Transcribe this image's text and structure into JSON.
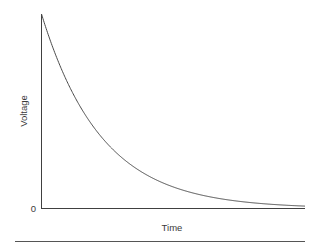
{
  "figure": {
    "background_color": "#ffffff",
    "axis_color": "#404040",
    "curve_color": "#4a4a4a",
    "text_color": "#3a3a3a",
    "rule_color": "#555555"
  },
  "chart_data": {
    "type": "line",
    "title": "",
    "subtitle": "",
    "xlabel": "Time",
    "ylabel": "Voltage",
    "x_tick_labels": [],
    "y_tick_labels": [
      "0"
    ],
    "grid": false,
    "legend": null,
    "annotations": [],
    "xlim": [
      0,
      4.4
    ],
    "ylim": [
      0,
      1.0
    ],
    "series": [
      {
        "name": "Capacitor discharge voltage",
        "description": "exponential decay V = V0 * exp(-t/tau), tau = 1",
        "x": [
          0.0,
          0.1,
          0.2,
          0.3,
          0.4,
          0.5,
          0.6,
          0.7,
          0.8,
          0.9,
          1.0,
          1.2,
          1.4,
          1.6,
          1.8,
          2.0,
          2.2,
          2.4,
          2.6,
          2.8,
          3.0,
          3.2,
          3.4,
          3.6,
          3.8,
          4.0,
          4.2,
          4.4
        ],
        "y": [
          1.0,
          0.905,
          0.819,
          0.741,
          0.67,
          0.607,
          0.549,
          0.497,
          0.449,
          0.407,
          0.368,
          0.301,
          0.247,
          0.202,
          0.165,
          0.135,
          0.111,
          0.091,
          0.074,
          0.061,
          0.05,
          0.041,
          0.033,
          0.027,
          0.022,
          0.018,
          0.015,
          0.012
        ]
      }
    ]
  },
  "labels": {
    "y_axis": "Voltage",
    "x_axis": "Time",
    "origin_tick": "0"
  }
}
